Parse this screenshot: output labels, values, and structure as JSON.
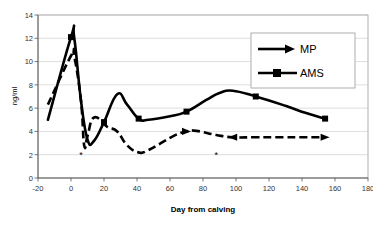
{
  "chart_data": {
    "type": "line",
    "title": "",
    "xlabel": "Day from calving",
    "ylabel": "ng/ml",
    "xlim": [
      -20,
      180
    ],
    "ylim": [
      0,
      14
    ],
    "xticks": [
      -20,
      0,
      20,
      40,
      60,
      80,
      100,
      120,
      140,
      160,
      180
    ],
    "xtick_labels": [
      "-20",
      "0",
      "20",
      "40",
      "60",
      "80",
      "100",
      "120",
      "140",
      "160",
      "180"
    ],
    "yticks": [
      0,
      2,
      4,
      6,
      8,
      10,
      12,
      14
    ],
    "ytick_labels": [
      "0",
      "2",
      "4",
      "6",
      "8",
      "10",
      "12",
      "14"
    ],
    "grid": "horizontal",
    "legend_position": "upper-right",
    "series": [
      {
        "name": "MP",
        "style": "dashed",
        "marker": "triangle",
        "x": [
          -14,
          0,
          2,
          6,
          8,
          10,
          14,
          22,
          28,
          34,
          41,
          47,
          62,
          70,
          76,
          88,
          98,
          112,
          128,
          142,
          154
        ],
        "y": [
          6.3,
          10.5,
          10.4,
          6.7,
          2.8,
          3.6,
          5.2,
          4.4,
          4.0,
          2.8,
          2.2,
          2.4,
          3.6,
          4.0,
          4.05,
          3.7,
          3.5,
          3.5,
          3.5,
          3.5,
          3.5
        ]
      },
      {
        "name": "AMS",
        "style": "solid",
        "marker": "square",
        "x": [
          -14,
          0,
          2,
          6,
          10,
          14,
          20,
          28,
          34,
          41,
          47,
          60,
          70,
          82,
          90,
          98,
          112,
          130,
          142,
          154
        ],
        "y": [
          5.0,
          12.1,
          12.0,
          6.7,
          3.3,
          3.2,
          4.8,
          7.2,
          6.3,
          5.1,
          5.0,
          5.3,
          5.7,
          6.7,
          7.3,
          7.5,
          7.0,
          6.2,
          5.6,
          5.1
        ]
      }
    ],
    "annotations": [
      {
        "label": "*",
        "x": 6,
        "y": 1.7
      },
      {
        "label": "*",
        "x": 88,
        "y": 1.75
      }
    ]
  },
  "legend": {
    "entries": [
      {
        "label": "MP"
      },
      {
        "label": "AMS"
      }
    ]
  }
}
